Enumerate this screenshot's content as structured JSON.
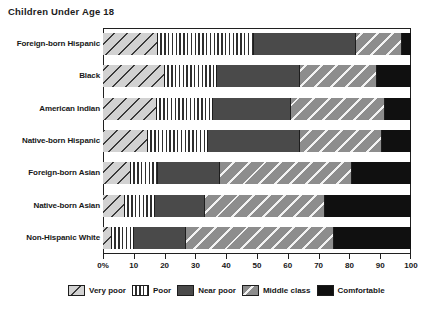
{
  "chart_data": {
    "type": "bar",
    "orientation": "horizontal",
    "stacked": true,
    "title": "Children Under Age 18",
    "xlabel": "",
    "ylabel": "",
    "xlim": [
      0,
      100
    ],
    "grid": false,
    "legend_position": "bottom",
    "units": "percent",
    "xticks": [
      {
        "value": 0,
        "label": "0%"
      },
      {
        "value": 10,
        "label": "10"
      },
      {
        "value": 20,
        "label": "20"
      },
      {
        "value": 30,
        "label": "30"
      },
      {
        "value": 40,
        "label": "40"
      },
      {
        "value": 50,
        "label": "50"
      },
      {
        "value": 60,
        "label": "60"
      },
      {
        "value": 70,
        "label": "70"
      },
      {
        "value": 80,
        "label": "80"
      },
      {
        "value": 90,
        "label": "90"
      },
      {
        "value": 100,
        "label": "100"
      }
    ],
    "categories": [
      "Foreign-born Hispanic",
      "Black",
      "American Indian",
      "Native-born Hispanic",
      "Foreign-born Asian",
      "Native-born Asian",
      "Non-Hispanic White"
    ],
    "series": [
      {
        "name": "Very poor",
        "pattern": "diagonal-hatch-light",
        "color": "#d2d2d2",
        "values": [
          18,
          20,
          17.5,
          14.5,
          9,
          7,
          3
        ]
      },
      {
        "name": "Poor",
        "pattern": "vertical-stripes",
        "color": "#ffffff",
        "values": [
          31,
          17,
          18.5,
          19.5,
          9,
          10,
          7
        ]
      },
      {
        "name": "Near poor",
        "pattern": "solid-dark-gray",
        "color": "#4a4a4a",
        "values": [
          33,
          27,
          25.5,
          30,
          20,
          16,
          17
        ]
      },
      {
        "name": "Middle class",
        "pattern": "diagonal-hatch-gray",
        "color": "#8d8d8d",
        "values": [
          15,
          25,
          30.5,
          26.5,
          43,
          39,
          48
        ]
      },
      {
        "name": "Comfortable",
        "pattern": "solid-black",
        "color": "#101010",
        "values": [
          3,
          11,
          8.5,
          9.5,
          19,
          28,
          25
        ]
      }
    ],
    "legend_entries": [
      {
        "label": "Very poor",
        "swatch": "diagonal-hatch-light"
      },
      {
        "label": "Poor",
        "swatch": "vertical-stripes"
      },
      {
        "label": "Near poor",
        "swatch": "solid-dark-gray"
      },
      {
        "label": "Middle class",
        "swatch": "diagonal-hatch-gray"
      },
      {
        "label": "Comfortable",
        "swatch": "solid-black"
      }
    ]
  }
}
